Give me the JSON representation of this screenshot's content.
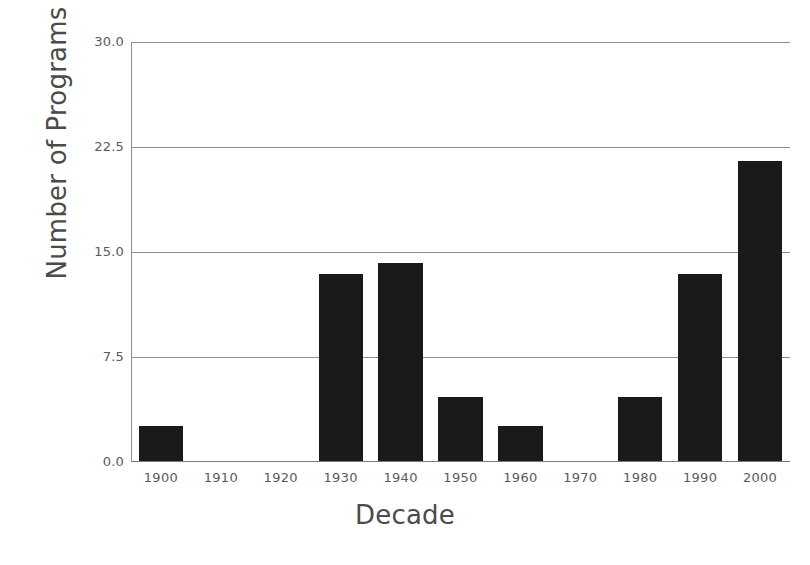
{
  "chart_data": {
    "type": "bar",
    "title": "",
    "xlabel": "Decade",
    "ylabel": "Number of Programs",
    "categories": [
      "1900",
      "1910",
      "1920",
      "1930",
      "1940",
      "1950",
      "1960",
      "1970",
      "1980",
      "1990",
      "2000"
    ],
    "values": [
      2.5,
      0,
      0,
      13.4,
      14.2,
      4.6,
      2.5,
      0,
      4.6,
      13.4,
      21.5
    ],
    "ylim": [
      0.0,
      30.0
    ],
    "yticks": [
      "0.0",
      "7.5",
      "15.0",
      "22.5",
      "30.0"
    ],
    "ytick_values": [
      0.0,
      7.5,
      15.0,
      22.5,
      30.0
    ],
    "grid": true,
    "legend": "none",
    "bar_color": "#1a1a1a",
    "grid_color": "#8f8f8f",
    "text_color": "#4b4b4b",
    "background_color": "#ffffff"
  },
  "axes": {
    "y_title": "Number of Programs",
    "x_title": "Decade"
  }
}
